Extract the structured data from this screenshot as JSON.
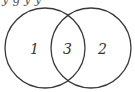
{
  "diagram": {
    "type": "venn",
    "stroke_color": "#3a3a3a",
    "background": "#ffffff",
    "top_text_fragment": "y  g        y y",
    "circles": [
      {
        "name": "left",
        "cx": 45,
        "cy": 48,
        "r": 40
      },
      {
        "name": "right",
        "cx": 91,
        "cy": 48,
        "r": 40
      }
    ],
    "regions": [
      {
        "name": "left-only",
        "label": "1"
      },
      {
        "name": "right-only",
        "label": "2"
      },
      {
        "name": "intersection",
        "label": "3"
      }
    ]
  }
}
